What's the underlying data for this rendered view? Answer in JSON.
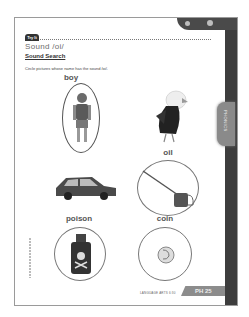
{
  "worksheet": {
    "badge": "Try It",
    "title": "Sound /oi/",
    "subtitle": "Sound Search",
    "instruction": "Circle pictures whose name has the sound /oi/.",
    "side_tab": "PHONICS",
    "footer_text": "LANGUAGE ARTS 6:30",
    "page_number": "PH 25"
  },
  "items": [
    {
      "label": "boy",
      "picture": "boy-image",
      "circled": true
    },
    {
      "label": "",
      "picture": "eagle-image",
      "circled": false
    },
    {
      "label": "",
      "picture": "car-image",
      "circled": false
    },
    {
      "label": "oil",
      "picture": "oil-can-image",
      "circled": true
    },
    {
      "label": "poison",
      "picture": "poison-bottle-image",
      "circled": true
    },
    {
      "label": "coin",
      "picture": "coin-image",
      "circled": true
    }
  ],
  "colors": {
    "page_border": "#9a9a9a",
    "dark_frame": "#3d3d3d",
    "tab_gray": "#8c8c8c",
    "title_gray": "#6d6d6d"
  }
}
